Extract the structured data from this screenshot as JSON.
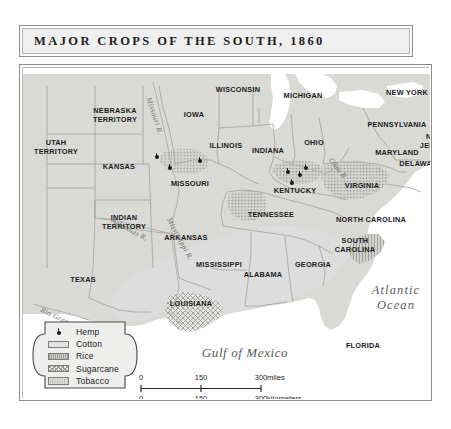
{
  "title": "MAJOR CROPS OF THE SOUTH, 1860",
  "legend": {
    "items": [
      {
        "label": "Hemp",
        "symbol": "dot",
        "icon": "hemp-dot-icon"
      },
      {
        "label": "Cotton",
        "symbol": "swatch",
        "icon": "cotton-swatch-icon"
      },
      {
        "label": "Rice",
        "symbol": "swatch",
        "icon": "rice-swatch-icon"
      },
      {
        "label": "Sugarcane",
        "symbol": "swatch",
        "icon": "sugarcane-swatch-icon"
      },
      {
        "label": "Tobacco",
        "symbol": "swatch",
        "icon": "tobacco-swatch-icon"
      }
    ]
  },
  "scale": {
    "miles": {
      "ticks": [
        "0",
        "150",
        "300"
      ],
      "unit": "miles"
    },
    "kilometers": {
      "ticks": [
        "0",
        "150",
        "300"
      ],
      "unit": "kilometers"
    }
  },
  "map": {
    "states": [
      {
        "name": "WISCONSIN",
        "x": 215,
        "y": 22
      },
      {
        "name": "MICHIGAN",
        "x": 280,
        "y": 28
      },
      {
        "name": "NEW YORK",
        "x": 384,
        "y": 25
      },
      {
        "name": "IOWA",
        "x": 171,
        "y": 47
      },
      {
        "name": "PENNSYLVANIA",
        "x": 374,
        "y": 57
      },
      {
        "name": "NEBRASKA\nTERRITORY",
        "x": 92,
        "y": 48
      },
      {
        "name": "UTAH\nTERRITORY",
        "x": 33,
        "y": 80
      },
      {
        "name": "ILLINOIS",
        "x": 203,
        "y": 78
      },
      {
        "name": "INDIANA",
        "x": 245,
        "y": 83
      },
      {
        "name": "OHIO",
        "x": 291,
        "y": 75
      },
      {
        "name": "NEW\nJERSEY",
        "x": 412,
        "y": 74
      },
      {
        "name": "MARYLAND",
        "x": 374,
        "y": 85
      },
      {
        "name": "DELAWARE",
        "x": 398,
        "y": 96
      },
      {
        "name": "KANSAS",
        "x": 96,
        "y": 99
      },
      {
        "name": "MISSOURI",
        "x": 167,
        "y": 116
      },
      {
        "name": "KENTUCKY",
        "x": 272,
        "y": 123
      },
      {
        "name": "VIRGINIA",
        "x": 339,
        "y": 118
      },
      {
        "name": "INDIAN\nTERRITORY",
        "x": 101,
        "y": 155
      },
      {
        "name": "ARKANSAS",
        "x": 163,
        "y": 170
      },
      {
        "name": "TENNESSEE",
        "x": 248,
        "y": 147
      },
      {
        "name": "NORTH CAROLINA",
        "x": 348,
        "y": 152
      },
      {
        "name": "SOUTH\nCAROLINA",
        "x": 332,
        "y": 178
      },
      {
        "name": "TEXAS",
        "x": 60,
        "y": 212
      },
      {
        "name": "MISSISSIPPI",
        "x": 196,
        "y": 197
      },
      {
        "name": "ALABAMA",
        "x": 240,
        "y": 207
      },
      {
        "name": "GEORGIA",
        "x": 290,
        "y": 197
      },
      {
        "name": "LOUISIANA",
        "x": 168,
        "y": 236
      },
      {
        "name": "FLORIDA",
        "x": 340,
        "y": 278
      }
    ],
    "waters": [
      {
        "name": "Gulf of Mexico",
        "x": 222,
        "y": 285
      },
      {
        "name": "Atlantic\nOcean",
        "x": 373,
        "y": 230
      }
    ],
    "rivers": [
      {
        "name": "Missouri R.",
        "x": 130,
        "y": 28,
        "rotate": 72
      },
      {
        "name": "Ohio R.",
        "x": 311,
        "y": 88,
        "rotate": 52
      },
      {
        "name": "Arkansas R.",
        "x": 91,
        "y": 148,
        "rotate": 28
      },
      {
        "name": "Mississippi R.",
        "x": 150,
        "y": 148,
        "rotate": 62
      },
      {
        "name": "Rio Grande",
        "x": 20,
        "y": 237,
        "rotate": 26
      }
    ],
    "hemp_dots": [
      {
        "x": 134,
        "y": 89
      },
      {
        "x": 147,
        "y": 100
      },
      {
        "x": 177,
        "y": 93
      },
      {
        "x": 265,
        "y": 104
      },
      {
        "x": 283,
        "y": 100
      },
      {
        "x": 277,
        "y": 107
      },
      {
        "x": 269,
        "y": 115
      }
    ]
  },
  "colors": {
    "land": "#d9d9d6",
    "water": "#ffffff",
    "border": "#8d8d8d",
    "title_bg": "#efefef",
    "text": "#1b1b1b",
    "cotton": "#dedede",
    "rice": "#cfcfcc",
    "sugarcane": "#e6e6e3",
    "tobacco": "#d6d6d3"
  }
}
